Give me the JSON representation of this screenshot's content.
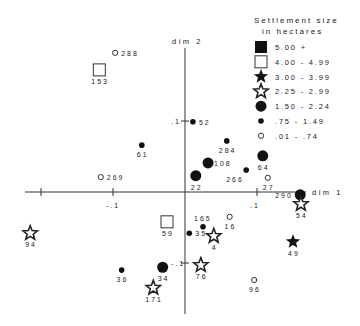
{
  "chart_data": {
    "type": "scatter",
    "title": "",
    "xlabel": "dim 1",
    "ylabel": "dim 2",
    "xlim": [
      -0.22,
      0.17
    ],
    "ylim": [
      -0.17,
      0.2
    ],
    "x_ticks": [
      {
        "value": -0.2,
        "label": ""
      },
      {
        "value": -0.1,
        "label": "-.1"
      },
      {
        "value": 0.1,
        "label": ".1"
      }
    ],
    "y_ticks": [
      {
        "value": 0.1,
        "label": ".1"
      },
      {
        "value": -0.1,
        "label": "-.1"
      }
    ],
    "grid": false,
    "legend": {
      "placement": "top-right",
      "title_line1": "Settlement size",
      "title_line2": "in hectares",
      "entries": [
        {
          "symbol": "filled-square",
          "label": "5.00 +"
        },
        {
          "symbol": "hollow-square",
          "label": "4.00 - 4.99"
        },
        {
          "symbol": "filled-star",
          "label": "3.00 - 3.99"
        },
        {
          "symbol": "hollow-star",
          "label": "2.25 - 2.99"
        },
        {
          "symbol": "large-dot",
          "label": "1.50 - 2.24"
        },
        {
          "symbol": "small-dot",
          "label": ".75 - 1.49"
        },
        {
          "symbol": "hollow-circle",
          "label": ".01 - .74"
        }
      ]
    },
    "points": [
      {
        "id": "288",
        "x": -0.097,
        "y": 0.196,
        "symbol": "hollow-circle",
        "label_pos": "right"
      },
      {
        "id": "153",
        "x": -0.119,
        "y": 0.172,
        "symbol": "hollow-square",
        "label_pos": "below"
      },
      {
        "id": "52",
        "x": 0.011,
        "y": 0.099,
        "symbol": "small-dot",
        "label_pos": "right"
      },
      {
        "id": "61",
        "x": -0.06,
        "y": 0.066,
        "symbol": "small-dot",
        "label_pos": "below"
      },
      {
        "id": "284",
        "x": 0.058,
        "y": 0.072,
        "symbol": "small-dot",
        "label_pos": "below"
      },
      {
        "id": "108",
        "x": 0.032,
        "y": 0.041,
        "symbol": "large-dot",
        "label_pos": "right"
      },
      {
        "id": "64",
        "x": 0.108,
        "y": 0.051,
        "symbol": "large-dot",
        "label_pos": "below"
      },
      {
        "id": "22",
        "x": 0.015,
        "y": 0.023,
        "symbol": "large-dot",
        "label_pos": "below"
      },
      {
        "id": "266",
        "x": 0.085,
        "y": 0.031,
        "symbol": "small-dot",
        "label_pos": "below-left"
      },
      {
        "id": "269",
        "x": -0.117,
        "y": 0.021,
        "symbol": "hollow-circle",
        "label_pos": "right"
      },
      {
        "id": "27",
        "x": 0.115,
        "y": 0.02,
        "symbol": "hollow-circle",
        "label_pos": "below"
      },
      {
        "id": "290",
        "x": 0.16,
        "y": -0.004,
        "symbol": "large-dot",
        "label_pos": "left"
      },
      {
        "id": "54",
        "x": 0.161,
        "y": -0.017,
        "symbol": "hollow-star",
        "label_pos": "below"
      },
      {
        "id": "49",
        "x": 0.15,
        "y": -0.07,
        "symbol": "filled-star",
        "label_pos": "below"
      },
      {
        "id": "94",
        "x": -0.215,
        "y": -0.058,
        "symbol": "hollow-star",
        "label_pos": "below"
      },
      {
        "id": "59",
        "x": -0.025,
        "y": -0.042,
        "symbol": "hollow-square",
        "label_pos": "below"
      },
      {
        "id": "165",
        "x": 0.025,
        "y": -0.049,
        "symbol": "small-dot",
        "label_pos": "above"
      },
      {
        "id": "16",
        "x": 0.062,
        "y": -0.035,
        "symbol": "hollow-circle",
        "label_pos": "below"
      },
      {
        "id": "35",
        "x": 0.006,
        "y": -0.058,
        "symbol": "small-dot",
        "label_pos": "right"
      },
      {
        "id": "4",
        "x": 0.04,
        "y": -0.062,
        "symbol": "hollow-star",
        "label_pos": "below"
      },
      {
        "id": "34",
        "x": -0.031,
        "y": -0.106,
        "symbol": "large-dot",
        "label_pos": "below"
      },
      {
        "id": "76",
        "x": 0.022,
        "y": -0.103,
        "symbol": "hollow-star",
        "label_pos": "below"
      },
      {
        "id": "36",
        "x": -0.088,
        "y": -0.11,
        "symbol": "small-dot",
        "label_pos": "below"
      },
      {
        "id": "171",
        "x": -0.044,
        "y": -0.135,
        "symbol": "hollow-star",
        "label_pos": "below"
      },
      {
        "id": "96",
        "x": 0.096,
        "y": -0.124,
        "symbol": "hollow-circle",
        "label_pos": "below"
      }
    ]
  }
}
